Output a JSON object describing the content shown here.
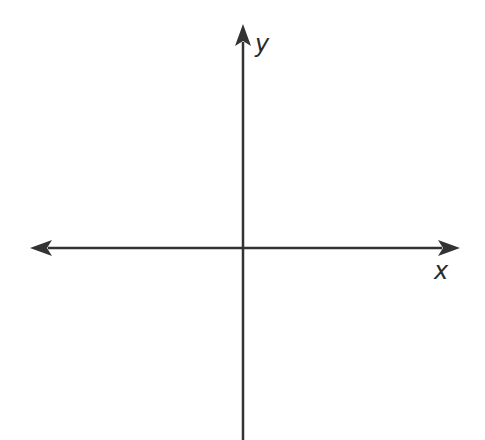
{
  "diagram": {
    "type": "coordinate-axes",
    "canvas": {
      "width": 485,
      "height": 440
    },
    "origin": {
      "x": 243,
      "y": 248
    },
    "stroke_color": "#333333",
    "stroke_width": 2.5,
    "x_axis": {
      "label": "x",
      "from": {
        "x": 30,
        "y": 248
      },
      "to": {
        "x": 460,
        "y": 248
      },
      "arrow_left": true,
      "arrow_right": true,
      "label_pos": {
        "x": 434,
        "y": 279
      }
    },
    "y_axis": {
      "label": "y",
      "from": {
        "x": 243,
        "y": 440
      },
      "to": {
        "x": 243,
        "y": 24
      },
      "arrow_top": true,
      "arrow_bottom": false,
      "label_pos": {
        "x": 255,
        "y": 52
      }
    }
  }
}
